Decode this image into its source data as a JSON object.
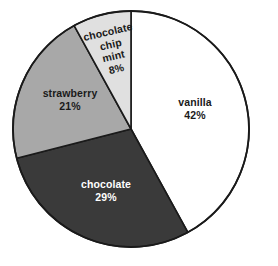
{
  "chart_data": {
    "type": "pie",
    "title": "",
    "subtitle": "",
    "xlabel": "",
    "ylabel": "",
    "legend_position": "none",
    "grid": false,
    "labels_inside_slices": true,
    "start_angle_deg": 0,
    "direction": "clockwise",
    "categories": [
      "vanilla",
      "chocolate",
      "strawberry",
      "chocolate chip mint"
    ],
    "values": [
      42,
      29,
      21,
      8
    ],
    "unit": "%",
    "total": 100,
    "slices": [
      {
        "name": "vanilla",
        "value": 42,
        "value_label": "42%",
        "color": "#ffffff",
        "stroke": "#1a1a1a",
        "text_color": "#1a1a1a"
      },
      {
        "name": "chocolate",
        "value": 29,
        "value_label": "29%",
        "color": "#3a3a3a",
        "stroke": "#1a1a1a",
        "text_color": "#ffffff"
      },
      {
        "name": "strawberry",
        "value": 21,
        "value_label": "21%",
        "color": "#a8a8a8",
        "stroke": "#1a1a1a",
        "text_color": "#1a1a1a"
      },
      {
        "name": "chocolate chip mint",
        "value": 8,
        "value_label": "8%",
        "color": "#e0e0e0",
        "stroke": "#1a1a1a",
        "text_color": "#1a1a1a"
      }
    ]
  },
  "labels": {
    "vanilla": {
      "name": "vanilla",
      "value": "42%"
    },
    "chocolate": {
      "name": "chocolate",
      "value": "29%"
    },
    "strawberry": {
      "name": "strawberry",
      "value": "21%"
    },
    "mint": {
      "line1": "chocolate",
      "line2": "chip",
      "line3": "mint",
      "value": "8%"
    }
  },
  "geometry": {
    "center_x": 131,
    "center_y": 129,
    "radius": 118,
    "canvas_width": 278,
    "canvas_height": 266
  },
  "colors": {
    "background": "#ffffff",
    "outline": "#1a1a1a",
    "vanilla": "#ffffff",
    "chocolate": "#3a3a3a",
    "strawberry": "#a8a8a8",
    "chocolate_chip_mint": "#e0e0e0"
  }
}
